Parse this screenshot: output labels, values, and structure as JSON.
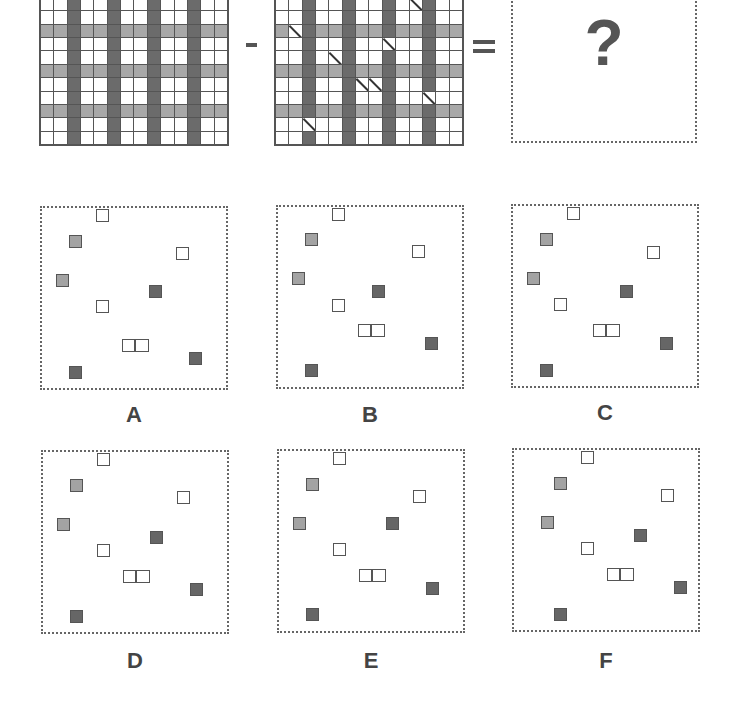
{
  "puzzle": {
    "question_mark": "?",
    "operator_minus": "-",
    "operator_equals": "=",
    "grid": {
      "cols": 14,
      "rows": 11,
      "dark_columns": [
        2,
        5,
        8,
        11
      ],
      "light_rows": [
        2,
        5,
        8
      ],
      "colors": {
        "white": "#ffffff",
        "light_gray": "#a8a8a8",
        "dark_gray": "#6b6b6b",
        "line": "#555555"
      }
    },
    "grid_a": {
      "diagonals": []
    },
    "grid_b": {
      "diagonals": [
        [
          0,
          10
        ],
        [
          2,
          1
        ],
        [
          3,
          8
        ],
        [
          4,
          4
        ],
        [
          6,
          6
        ],
        [
          6,
          7
        ],
        [
          7,
          11
        ],
        [
          9,
          2
        ]
      ]
    }
  },
  "options": [
    {
      "label": "A",
      "x": 40,
      "y": 206,
      "label_y": 402,
      "items": [
        {
          "type": "white",
          "x": 54,
          "y": 1
        },
        {
          "type": "gray",
          "x": 27,
          "y": 27
        },
        {
          "type": "white",
          "x": 134,
          "y": 39
        },
        {
          "type": "gray",
          "x": 14,
          "y": 66
        },
        {
          "type": "dark",
          "x": 107,
          "y": 77
        },
        {
          "type": "white",
          "x": 54,
          "y": 92
        },
        {
          "type": "pair",
          "x": 80,
          "y": 131
        },
        {
          "type": "dark",
          "x": 147,
          "y": 144
        },
        {
          "type": "dark",
          "x": 27,
          "y": 158
        }
      ]
    },
    {
      "label": "B",
      "x": 276,
      "y": 205,
      "label_y": 402,
      "items": [
        {
          "type": "white",
          "x": 54,
          "y": 1
        },
        {
          "type": "gray",
          "x": 27,
          "y": 26
        },
        {
          "type": "white",
          "x": 134,
          "y": 38
        },
        {
          "type": "gray",
          "x": 14,
          "y": 65
        },
        {
          "type": "dark",
          "x": 94,
          "y": 78
        },
        {
          "type": "white",
          "x": 54,
          "y": 92
        },
        {
          "type": "pair",
          "x": 80,
          "y": 117
        },
        {
          "type": "dark",
          "x": 147,
          "y": 130
        },
        {
          "type": "dark",
          "x": 27,
          "y": 157
        }
      ]
    },
    {
      "label": "C",
      "x": 511,
      "y": 204,
      "label_y": 400,
      "items": [
        {
          "type": "white",
          "x": 54,
          "y": 1
        },
        {
          "type": "gray",
          "x": 27,
          "y": 27
        },
        {
          "type": "white",
          "x": 134,
          "y": 40
        },
        {
          "type": "gray",
          "x": 14,
          "y": 66
        },
        {
          "type": "dark",
          "x": 107,
          "y": 79
        },
        {
          "type": "white",
          "x": 41,
          "y": 92
        },
        {
          "type": "pair",
          "x": 80,
          "y": 118
        },
        {
          "type": "dark",
          "x": 147,
          "y": 131
        },
        {
          "type": "dark",
          "x": 27,
          "y": 158
        }
      ]
    },
    {
      "label": "D",
      "x": 41,
      "y": 450,
      "label_y": 648,
      "items": [
        {
          "type": "white",
          "x": 54,
          "y": 1
        },
        {
          "type": "gray",
          "x": 27,
          "y": 27
        },
        {
          "type": "white",
          "x": 134,
          "y": 39
        },
        {
          "type": "gray",
          "x": 14,
          "y": 66
        },
        {
          "type": "dark",
          "x": 107,
          "y": 79
        },
        {
          "type": "white",
          "x": 54,
          "y": 92
        },
        {
          "type": "pair",
          "x": 80,
          "y": 118
        },
        {
          "type": "dark",
          "x": 147,
          "y": 131
        },
        {
          "type": "dark",
          "x": 27,
          "y": 158
        }
      ]
    },
    {
      "label": "E",
      "x": 277,
      "y": 449,
      "label_y": 648,
      "items": [
        {
          "type": "white",
          "x": 54,
          "y": 1
        },
        {
          "type": "gray",
          "x": 27,
          "y": 27
        },
        {
          "type": "white",
          "x": 134,
          "y": 39
        },
        {
          "type": "gray",
          "x": 14,
          "y": 66
        },
        {
          "type": "dark",
          "x": 107,
          "y": 66
        },
        {
          "type": "white",
          "x": 54,
          "y": 92
        },
        {
          "type": "pair",
          "x": 80,
          "y": 118
        },
        {
          "type": "dark",
          "x": 147,
          "y": 131
        },
        {
          "type": "dark",
          "x": 27,
          "y": 157
        }
      ]
    },
    {
      "label": "F",
      "x": 512,
      "y": 448,
      "label_y": 648,
      "items": [
        {
          "type": "white",
          "x": 67,
          "y": 1
        },
        {
          "type": "gray",
          "x": 40,
          "y": 27
        },
        {
          "type": "white",
          "x": 147,
          "y": 39
        },
        {
          "type": "gray",
          "x": 27,
          "y": 66
        },
        {
          "type": "dark",
          "x": 120,
          "y": 79
        },
        {
          "type": "white",
          "x": 67,
          "y": 92
        },
        {
          "type": "pair",
          "x": 93,
          "y": 118
        },
        {
          "type": "dark",
          "x": 160,
          "y": 131
        },
        {
          "type": "dark",
          "x": 40,
          "y": 158
        }
      ]
    }
  ]
}
